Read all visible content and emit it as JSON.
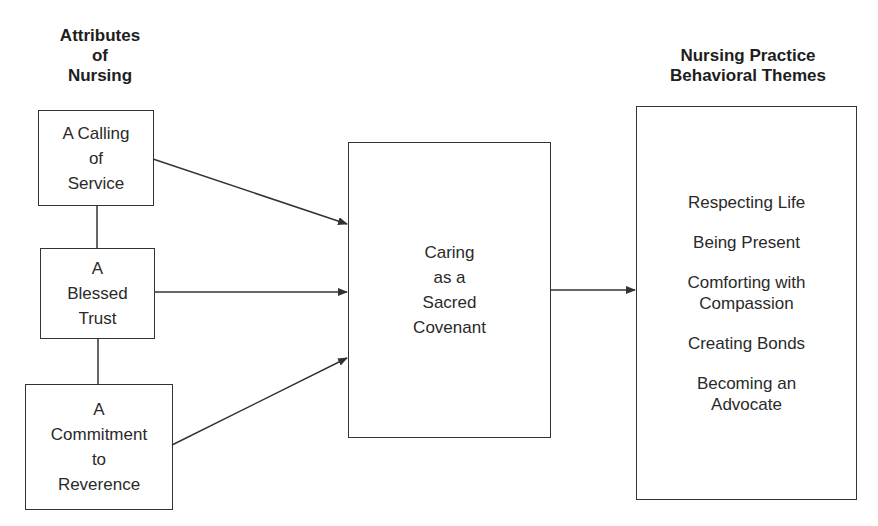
{
  "diagram": {
    "left_heading": "Attributes\nof\nNursing",
    "right_heading": "Nursing Practice\nBehavioral Themes",
    "attributes": [
      {
        "label": "A Calling\nof\nService"
      },
      {
        "label": "A\nBlessed\nTrust"
      },
      {
        "label": "A\nCommitment\nto\nReverence"
      }
    ],
    "center": {
      "label": "Caring\nas a\nSacred\nCovenant"
    },
    "themes": [
      {
        "label": "Respecting Life"
      },
      {
        "label": "Being Present"
      },
      {
        "label": "Comforting with\nCompassion"
      },
      {
        "label": "Creating Bonds"
      },
      {
        "label": "Becoming an\nAdvocate"
      }
    ],
    "edges": [
      {
        "from": "A Calling of Service",
        "to": "Caring as a Sacred Covenant",
        "type": "arrow"
      },
      {
        "from": "A Blessed Trust",
        "to": "Caring as a Sacred Covenant",
        "type": "arrow"
      },
      {
        "from": "A Commitment to Reverence",
        "to": "Caring as a Sacred Covenant",
        "type": "arrow"
      },
      {
        "from": "Caring as a Sacred Covenant",
        "to": "Nursing Practice Behavioral Themes",
        "type": "arrow"
      },
      {
        "from": "A Calling of Service",
        "to": "A Blessed Trust",
        "type": "line"
      },
      {
        "from": "A Blessed Trust",
        "to": "A Commitment to Reverence",
        "type": "line"
      }
    ],
    "colors": {
      "stroke": "#333333",
      "text": "#2a2a2a",
      "background": "#ffffff"
    }
  }
}
